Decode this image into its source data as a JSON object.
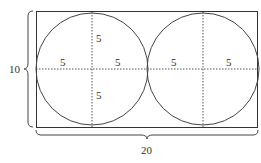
{
  "diagram": {
    "rectangle": {
      "width_label": "20",
      "height_label": "10"
    },
    "circles": [
      {
        "radius_labels": {
          "top": "5",
          "bottom": "5",
          "left": "5",
          "right": "5"
        }
      },
      {
        "radius_labels": {
          "left": "5",
          "right": "5"
        }
      }
    ],
    "colors": {
      "stroke": "#333333",
      "background": "#ffffff"
    }
  }
}
